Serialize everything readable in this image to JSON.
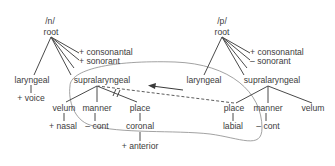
{
  "diagram": {
    "type": "feature-geometry",
    "colors": {
      "line": "#4a4a4a",
      "ellipse": "#8a8a8a",
      "text": "#3c3c3c",
      "background": "#ffffff"
    },
    "left_tree": {
      "segment": "/n/",
      "root": "root",
      "root_features": [
        "+ consonantal",
        "+ sonorant"
      ],
      "laryngeal": "laryngeal",
      "laryngeal_feature": "+ voice",
      "supralaryngeal": "supralaryngeal",
      "velum": "velum",
      "velum_feature": "+ nasal",
      "manner": "manner",
      "manner_feature": "– cont",
      "place": "place",
      "place_feature": "coronal",
      "place_subfeature": "+ anterior",
      "delink_mark": "//"
    },
    "right_tree": {
      "segment": "/p/",
      "root": "root",
      "root_features": [
        "+ consonantal",
        "– sonorant"
      ],
      "laryngeal": "laryngeal",
      "supralaryngeal": "supralaryngeal",
      "place": "place",
      "place_feature": "labial",
      "manner": "manner",
      "manner_feature": "– cont",
      "velum": "velum"
    },
    "annotations": {
      "spreading_line": "dashed line from /p/ place to /n/ supralaryngeal",
      "arrow_direction": "leftward",
      "ellipse": "encircles /n/ supralaryngeal subtree and /p/ place node"
    }
  }
}
